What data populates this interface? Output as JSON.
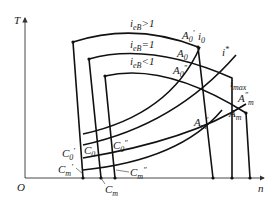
{
  "diagram": {
    "axes": {
      "y_label": "T",
      "x_label": "n",
      "origin_label": "O"
    },
    "curves": [
      {
        "id": "outer",
        "label_base": "i",
        "label_sub": "eB",
        "label_rel": ">1"
      },
      {
        "id": "middle",
        "label_base": "i",
        "label_sub": "eB",
        "label_rel": "=1"
      },
      {
        "id": "inner",
        "label_base": "i",
        "label_sub": "eB",
        "label_rel": "<1"
      }
    ],
    "lines": {
      "i0": {
        "base": "i",
        "sub": "0"
      },
      "istar": {
        "base": "i",
        "sup": "*"
      },
      "imax": {
        "base": "i",
        "sub": "max"
      }
    },
    "points": {
      "A0p": {
        "base": "A",
        "sub": "0",
        "sup": "′"
      },
      "A0": {
        "base": "A",
        "sub": "0",
        "sup": ""
      },
      "A0pp": {
        "base": "A",
        "sub": "0",
        "sup": "″"
      },
      "Amp": {
        "base": "A",
        "sub": "m",
        "sup": "′"
      },
      "Am": {
        "base": "A",
        "sub": "m",
        "sup": ""
      },
      "Ampp": {
        "base": "A",
        "sub": "m",
        "sup": "″"
      },
      "C0p": {
        "base": "C",
        "sub": "0",
        "sup": "′"
      },
      "C0": {
        "base": "C",
        "sub": "0",
        "sup": ""
      },
      "C0pp": {
        "base": "C",
        "sub": "0",
        "sup": "″"
      },
      "Cmp": {
        "base": "C",
        "sub": "m",
        "sup": "′"
      },
      "Cm": {
        "base": "C",
        "sub": "m",
        "sup": ""
      },
      "Cmpp": {
        "base": "C",
        "sub": "m",
        "sup": "″"
      }
    }
  }
}
